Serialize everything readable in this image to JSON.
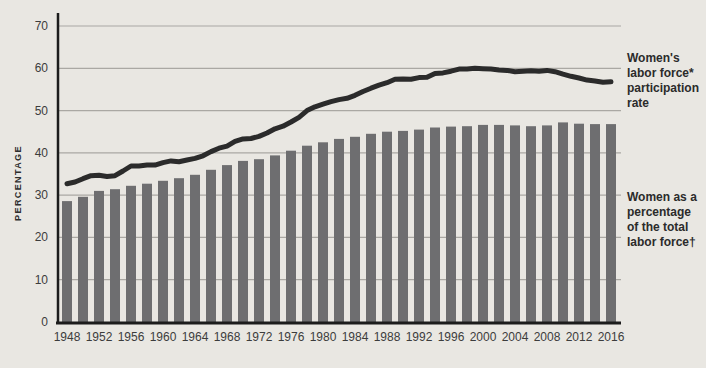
{
  "annotations": {
    "line_label": "Women's\nlabor force*\nparticipation\nrate",
    "bar_label": "Women as a\npercentage\nof the total\nlabor force†"
  },
  "chart_data": {
    "type": "bar+line",
    "title": "",
    "xlabel": "",
    "ylabel": "PERCENTAGE",
    "ylim": [
      0,
      70
    ],
    "yticks": [
      0,
      10,
      20,
      30,
      40,
      50,
      60,
      70
    ],
    "grid": "horizontal",
    "legend_position": "right-annotations",
    "xtick_labels": [
      "1948",
      "1952",
      "1956",
      "1960",
      "1964",
      "1968",
      "1972",
      "1976",
      "1980",
      "1984",
      "1988",
      "1992",
      "1996",
      "2000",
      "2004",
      "2008",
      "2012",
      "2016"
    ],
    "bar_series": {
      "name": "Women as a percentage of the total labor force†",
      "years": [
        1948,
        1950,
        1952,
        1954,
        1956,
        1958,
        1960,
        1962,
        1964,
        1966,
        1968,
        1970,
        1972,
        1974,
        1976,
        1978,
        1980,
        1982,
        1984,
        1986,
        1988,
        1990,
        1992,
        1994,
        1996,
        1998,
        2000,
        2002,
        2004,
        2006,
        2008,
        2010,
        2012,
        2014,
        2016
      ],
      "values": [
        28.6,
        29.6,
        31.0,
        31.4,
        32.2,
        32.7,
        33.4,
        34.0,
        34.8,
        36.0,
        37.1,
        38.1,
        38.5,
        39.4,
        40.5,
        41.7,
        42.5,
        43.3,
        43.8,
        44.5,
        45.0,
        45.2,
        45.5,
        46.0,
        46.2,
        46.3,
        46.6,
        46.6,
        46.5,
        46.3,
        46.5,
        47.2,
        46.9,
        46.8,
        46.8
      ]
    },
    "line_series": {
      "name": "Women's labor force* participation rate",
      "years": [
        1948,
        1949,
        1950,
        1951,
        1952,
        1953,
        1954,
        1955,
        1956,
        1957,
        1958,
        1959,
        1960,
        1961,
        1962,
        1963,
        1964,
        1965,
        1966,
        1967,
        1968,
        1969,
        1970,
        1971,
        1972,
        1973,
        1974,
        1975,
        1976,
        1977,
        1978,
        1979,
        1980,
        1981,
        1982,
        1983,
        1984,
        1985,
        1986,
        1987,
        1988,
        1989,
        1990,
        1991,
        1992,
        1993,
        1994,
        1995,
        1996,
        1997,
        1998,
        1999,
        2000,
        2001,
        2002,
        2003,
        2004,
        2005,
        2006,
        2007,
        2008,
        2009,
        2010,
        2011,
        2012,
        2013,
        2014,
        2015,
        2016
      ],
      "values": [
        32.7,
        33.1,
        33.9,
        34.6,
        34.7,
        34.4,
        34.6,
        35.7,
        36.9,
        36.9,
        37.1,
        37.1,
        37.7,
        38.1,
        37.9,
        38.3,
        38.7,
        39.3,
        40.3,
        41.1,
        41.6,
        42.7,
        43.3,
        43.4,
        43.9,
        44.7,
        45.7,
        46.3,
        47.3,
        48.4,
        50.0,
        50.9,
        51.5,
        52.1,
        52.6,
        52.9,
        53.6,
        54.5,
        55.3,
        56.0,
        56.6,
        57.4,
        57.5,
        57.4,
        57.8,
        57.9,
        58.8,
        58.9,
        59.3,
        59.8,
        59.8,
        60.0,
        59.9,
        59.8,
        59.6,
        59.5,
        59.2,
        59.3,
        59.4,
        59.3,
        59.5,
        59.2,
        58.6,
        58.1,
        57.7,
        57.2,
        57.0,
        56.7,
        56.8
      ]
    },
    "colors": {
      "background": "#e9e7e2",
      "bar": "#6e6e70",
      "line": "#2b2b2b",
      "grid": "#aaa8a3",
      "axis": "#1c1c1c",
      "tick_text": "#3c3c3c"
    }
  }
}
